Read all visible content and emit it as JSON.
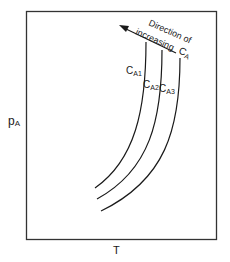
{
  "diagram": {
    "y_axis_label": "p",
    "y_axis_subscript": "A",
    "x_axis_label": "T",
    "curves": [
      {
        "label": "C",
        "sub": "A1"
      },
      {
        "label": "C",
        "sub": "A2"
      },
      {
        "label": "C",
        "sub": "A3"
      }
    ],
    "arrow_text_line1": "Direction of",
    "arrow_text_line2": "increasing",
    "arrow_text_var": "C",
    "arrow_text_var_sub": "A",
    "colors": {
      "stroke": "#1a1a1a",
      "frame": "#333333",
      "background": "#ffffff"
    }
  }
}
